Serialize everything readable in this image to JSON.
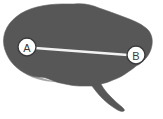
{
  "figure": {
    "background_color": "#ffffff",
    "width": 163,
    "height": 119
  },
  "brain": {
    "label": "brain-silhouette",
    "fill_color": "#575757",
    "outline_color": "#6a6a6a"
  },
  "measurement": {
    "label": "measurement-line",
    "line_color": "#f2f2f2",
    "from_point": "A",
    "to_point": "B"
  },
  "markers": [
    {
      "id": "A",
      "letter": "A",
      "cx": 27,
      "cy": 47,
      "r": 9,
      "circle_fill": "#ffffff",
      "circle_stroke": "#3a3a3a",
      "letter_color": "#3a3a3a"
    },
    {
      "id": "B",
      "letter": "B",
      "cx": 136,
      "cy": 55,
      "r": 9,
      "circle_fill": "#ffffff",
      "circle_stroke": "#3a3a3a",
      "letter_color": "#3a3a3a"
    }
  ]
}
